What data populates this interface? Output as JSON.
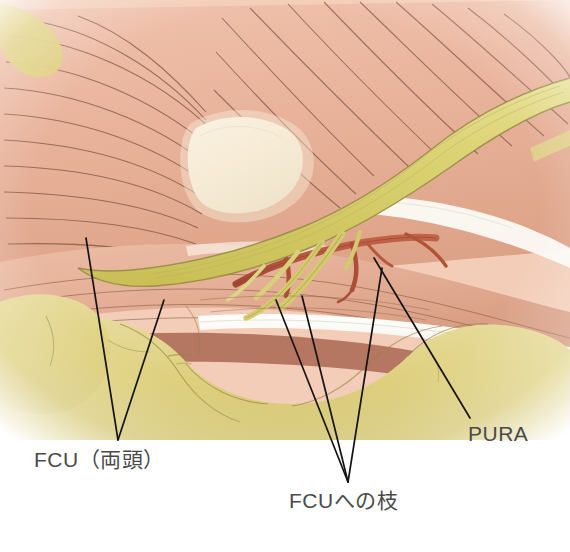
{
  "figure": {
    "type": "anatomical-illustration",
    "background_color": "#ffffff"
  },
  "labels": [
    {
      "id": "fcu-heads",
      "text": "FCU（両頭）",
      "leader_count": 2
    },
    {
      "id": "fcu-branch",
      "text": "FCUへの枝",
      "leader_count": 3
    },
    {
      "id": "pura",
      "text": "PURA",
      "leader_count": 1
    }
  ],
  "colors": {
    "muscle_pink": "#e9b39b",
    "muscle_pink_dark": "#d8987f",
    "muscle_pink_light": "#f2cbb8",
    "nerve_yellow": "#d9d06d",
    "nerve_yellow_light": "#e6dd8e",
    "fat_yellow": "#ded07e",
    "fat_yellow_light": "#e8dc9b",
    "tendon_white": "#fdfdfb",
    "tendon_cream": "#f7edd8",
    "vessel_red": "#b5543c",
    "vessel_red_dark": "#9e4430",
    "line_dark": "#3b3226",
    "leader_line": "#1a1a1a",
    "label_text": "#4a4a4a"
  },
  "structures": [
    {
      "name": "flexor-carpi-ulnaris-muscle",
      "tissue": "muscle",
      "color": "#e9b39b"
    },
    {
      "name": "ulnar-nerve-trunk",
      "tissue": "nerve",
      "color": "#d9d06d"
    },
    {
      "name": "fcu-motor-branch",
      "tissue": "nerve",
      "color": "#d9d06d"
    },
    {
      "name": "ulnar-recurrent-artery",
      "tissue": "vessel",
      "color": "#b5543c"
    },
    {
      "name": "subcutaneous-fat",
      "tissue": "fat",
      "color": "#ded07e"
    },
    {
      "name": "aponeurosis-tendon",
      "tissue": "tendon",
      "color": "#fdfdfb"
    },
    {
      "name": "humeral-epicondyle-tendon",
      "tissue": "tendon",
      "color": "#f7edd8"
    }
  ]
}
